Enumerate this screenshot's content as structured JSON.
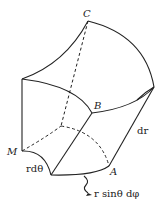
{
  "diagram": {
    "type": "spherical volume element",
    "labels": {
      "C": "C",
      "B": "B",
      "M": "M",
      "A": "A",
      "dr": "dr",
      "r_dtheta": "rdθ",
      "r_sin_dphi": "r sinθ dφ"
    },
    "colors": {
      "line": "#222222",
      "background": "#ffffff"
    }
  }
}
